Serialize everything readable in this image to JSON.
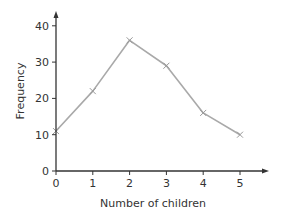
{
  "chart_data": {
    "type": "line",
    "title": "",
    "xlabel": "Number of children",
    "ylabel": "Frequency",
    "x": [
      0,
      1,
      2,
      3,
      4,
      5
    ],
    "series": [
      {
        "name": "Frequency",
        "values": [
          11,
          22,
          36,
          29,
          16,
          10
        ],
        "marker": "x"
      }
    ],
    "xticks": [
      0,
      1,
      2,
      3,
      4,
      5
    ],
    "yticks": [
      0,
      10,
      20,
      30,
      40
    ],
    "xlim": [
      0,
      5.8
    ],
    "ylim": [
      0,
      43
    ],
    "grid": false,
    "legend": null
  },
  "colors": {
    "axis": "#333333",
    "line": "#a9a9a9",
    "text": "#333333",
    "background": "#ffffff"
  }
}
